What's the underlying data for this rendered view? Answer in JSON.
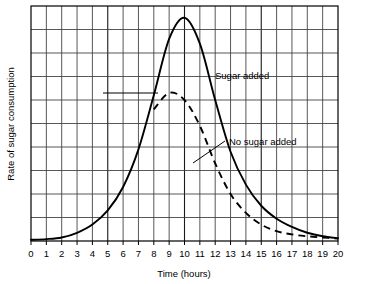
{
  "chart_data": {
    "type": "line",
    "title": "",
    "xlabel": "Time (hours)",
    "ylabel": "Rate of sugar consumption",
    "xlim": [
      0,
      20
    ],
    "ylim": [
      0,
      10
    ],
    "grid": true,
    "legend_position": "inline-annotations",
    "xticks": [
      "0",
      "1",
      "2",
      "3",
      "4",
      "5",
      "6",
      "7",
      "8",
      "9",
      "10",
      "11",
      "12",
      "13",
      "14",
      "15",
      "16",
      "17",
      "18",
      "19",
      "20"
    ],
    "yticks": [],
    "x": [
      0,
      1,
      2,
      3,
      4,
      5,
      6,
      7,
      8,
      9,
      10,
      11,
      12,
      13,
      14,
      15,
      16,
      17,
      18,
      19,
      20
    ],
    "series": [
      {
        "name": "Sugar added",
        "style": "solid",
        "color": "#000000",
        "annotation": "Sugar added",
        "values": [
          0.05,
          0.08,
          0.15,
          0.35,
          0.7,
          1.3,
          2.3,
          3.9,
          6.2,
          8.6,
          9.5,
          8.4,
          6.0,
          3.8,
          2.4,
          1.5,
          0.95,
          0.6,
          0.35,
          0.2,
          0.12
        ]
      },
      {
        "name": "No sugar added",
        "style": "dashed",
        "color": "#000000",
        "annotation": "No sugar added",
        "values": [
          0.05,
          0.08,
          0.15,
          0.35,
          0.7,
          1.3,
          2.3,
          3.9,
          5.6,
          6.3,
          6.0,
          4.9,
          3.3,
          2.0,
          1.2,
          0.7,
          0.42,
          0.28,
          0.2,
          0.15,
          0.1
        ]
      }
    ],
    "annotations": [
      {
        "text": "Sugar added",
        "x": 12.6,
        "y": 7.4
      },
      {
        "text": "No sugar added",
        "x": 13.6,
        "y": 4.95
      }
    ]
  },
  "axis": {
    "x_title": "Time (hours)",
    "y_title": "Rate of sugar consumption"
  },
  "labels": {
    "sugar_added": "Sugar added",
    "no_sugar_added": "No sugar added"
  },
  "ticks": {
    "x": [
      "0",
      "1",
      "2",
      "3",
      "4",
      "5",
      "6",
      "7",
      "8",
      "9",
      "10",
      "11",
      "12",
      "13",
      "14",
      "15",
      "16",
      "17",
      "18",
      "19",
      "20"
    ]
  },
  "colors": {
    "axis": "#000000",
    "grid_major": "#1a1a1a",
    "grid_minor": "#8c8c8c",
    "curve": "#000000",
    "background": "#ffffff"
  }
}
